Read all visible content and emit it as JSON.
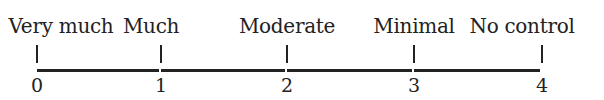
{
  "scale": {
    "points": [
      {
        "value": "0",
        "label": "Very much",
        "x": 37
      },
      {
        "value": "1",
        "label": "Much",
        "x": 161
      },
      {
        "value": "2",
        "label": "Moderate",
        "x": 287
      },
      {
        "value": "3",
        "label": "Minimal",
        "x": 414
      },
      {
        "value": "4",
        "label": "No control",
        "x": 542
      }
    ],
    "line_color": "#222222"
  }
}
